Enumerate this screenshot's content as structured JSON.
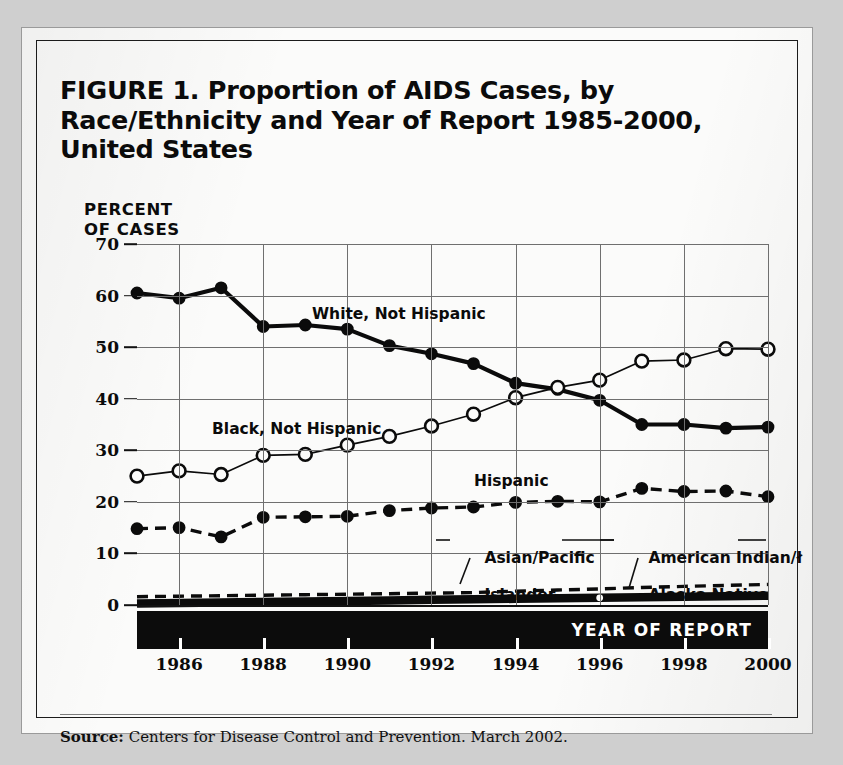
{
  "figure": {
    "title": "FIGURE 1.  Proportion of AIDS Cases, by Race/Ethnicity and Year of Report 1985-2000, United States",
    "y_axis_title_line1": "PERCENT",
    "y_axis_title_line2": "OF CASES",
    "x_band_label": "YEAR OF REPORT",
    "source_prefix": "Source:",
    "source_text": "Centers for Disease Control and Prevention. March 2002."
  },
  "annotations": {
    "white": "White, Not Hispanic",
    "black": "Black, Not Hispanic",
    "hispanic": "Hispanic",
    "asian_line1": "Asian/Pacific",
    "asian_line2": "Islander",
    "amind_line1": "American Indian/ł",
    "amind_line2": "Alaska Native"
  },
  "chart_data": {
    "type": "line",
    "title": "FIGURE 1.  Proportion of AIDS Cases, by Race/Ethnicity and Year of Report 1985-2000, United States",
    "xlabel": "YEAR OF REPORT",
    "ylabel": "PERCENT OF CASES",
    "xlim": [
      1985,
      2000
    ],
    "ylim": [
      0,
      70
    ],
    "yticks": [
      0,
      10,
      20,
      30,
      40,
      50,
      60,
      70
    ],
    "xticks": [
      1986,
      1988,
      1990,
      1992,
      1994,
      1996,
      1998,
      2000
    ],
    "grid": true,
    "legend": "inline-annotations",
    "x": [
      1985,
      1986,
      1987,
      1988,
      1989,
      1990,
      1991,
      1992,
      1993,
      1994,
      1995,
      1996,
      1997,
      1998,
      1999,
      2000
    ],
    "series": [
      {
        "name": "White, Not Hispanic",
        "marker": "filled-circle",
        "line": "solid-thick",
        "values": [
          60.5,
          59.5,
          61.5,
          54.0,
          54.3,
          53.5,
          50.3,
          48.7,
          46.8,
          43.0,
          41.8,
          39.7,
          35.0,
          35.0,
          34.3,
          34.5
        ]
      },
      {
        "name": "Black, Not Hispanic",
        "marker": "open-circle",
        "line": "solid-thin",
        "values": [
          25.0,
          26.0,
          25.3,
          29.0,
          29.2,
          31.0,
          32.7,
          34.7,
          37.0,
          40.2,
          42.2,
          43.6,
          47.3,
          47.5,
          49.7,
          49.6
        ]
      },
      {
        "name": "Hispanic",
        "marker": "filled-circle",
        "line": "dashed",
        "values": [
          14.8,
          15.0,
          13.2,
          17.0,
          17.1,
          17.2,
          18.3,
          18.8,
          19.0,
          19.9,
          20.1,
          20.0,
          22.6,
          22.0,
          22.1,
          21.0
        ]
      },
      {
        "name": "Asian/Pacific Islander",
        "marker": "none",
        "line": "dashed",
        "values": [
          1.6,
          1.7,
          1.8,
          1.9,
          2.0,
          2.1,
          2.2,
          2.3,
          2.4,
          2.7,
          2.9,
          3.1,
          3.4,
          3.6,
          3.8,
          4.0
        ]
      },
      {
        "name": "American Indian/Alaska Native",
        "marker": "open-dot-1996",
        "line": "solid-very-thick",
        "values": [
          0.3,
          0.4,
          0.5,
          0.6,
          0.7,
          0.8,
          0.9,
          1.0,
          1.1,
          1.2,
          1.3,
          1.4,
          1.5,
          1.6,
          1.7,
          1.8
        ]
      }
    ]
  },
  "colors": {
    "ink": "#0b0b0b",
    "grid": "#6f6f6f",
    "paper": "#fbfbfa",
    "band": "#0c0c0c"
  }
}
